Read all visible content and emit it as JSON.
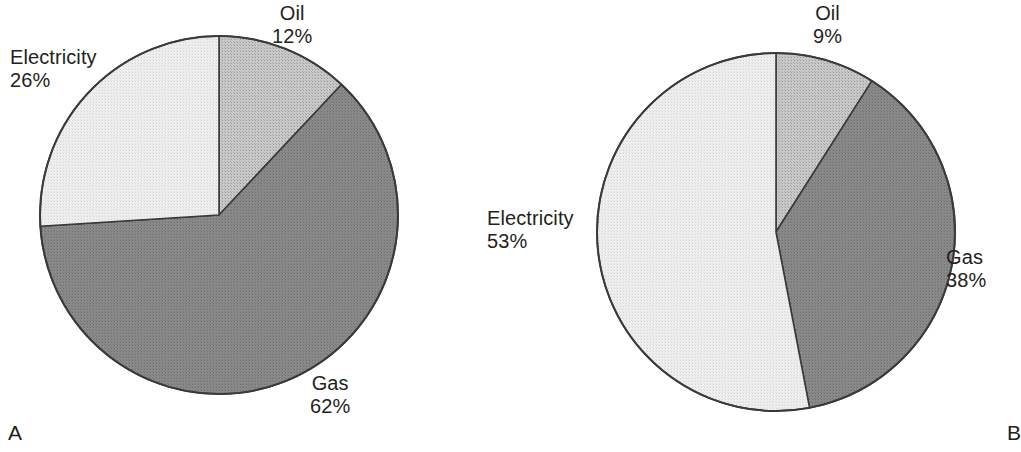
{
  "figure": {
    "background_color": "#ffffff",
    "text_color": "#231f20"
  },
  "palette": {
    "oil": "#c9c9c9",
    "gas": "#8a8a8a",
    "electricity": "#efefef",
    "outline": "#3a3a3a"
  },
  "panels": [
    {
      "letter": "A",
      "labels": {
        "electricity": {
          "name": "Electricity",
          "percent": "26%"
        },
        "oil": {
          "name": "Oil",
          "percent": "12%"
        },
        "gas": {
          "name": "Gas",
          "percent": "62%"
        }
      }
    },
    {
      "letter": "B",
      "labels": {
        "electricity": {
          "name": "Electricity",
          "percent": "53%"
        },
        "oil": {
          "name": "Oil",
          "percent": "9%"
        },
        "gas": {
          "name": "Gas",
          "percent": "38%"
        }
      }
    }
  ],
  "chart_data": [
    {
      "type": "pie",
      "title": "A",
      "categories": [
        "Oil",
        "Gas",
        "Electricity"
      ],
      "values": [
        12,
        62,
        26
      ],
      "unit": "percent",
      "labels": [
        "Oil 12%",
        "Gas 62%",
        "Electricity 26%"
      ],
      "colors": [
        "#c9c9c9",
        "#8a8a8a",
        "#efefef"
      ],
      "start_angle_deg": 0,
      "direction": "clockwise",
      "legend": "none",
      "annotations": [
        "A"
      ]
    },
    {
      "type": "pie",
      "title": "B",
      "categories": [
        "Oil",
        "Gas",
        "Electricity"
      ],
      "values": [
        9,
        38,
        53
      ],
      "unit": "percent",
      "labels": [
        "Oil 9%",
        "Gas 38%",
        "Electricity 53%"
      ],
      "colors": [
        "#c9c9c9",
        "#8a8a8a",
        "#efefef"
      ],
      "start_angle_deg": 0,
      "direction": "clockwise",
      "legend": "none",
      "annotations": [
        "B"
      ]
    }
  ]
}
